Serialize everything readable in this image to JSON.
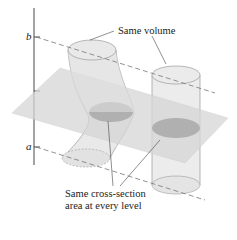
{
  "figure": {
    "topic": "Cavalieri's principle: solids with equal cross-section areas have equal volume",
    "axis_labels": {
      "top": "b",
      "bottom": "a"
    },
    "callouts": {
      "volume": "Same volume",
      "cross_section_line1": "Same cross-section",
      "cross_section_line2": "area at every level"
    },
    "colors": {
      "plane_fill": "#d9d9d9",
      "solid_fill": "#e6e6e6",
      "solid_stroke": "#9a9a9a",
      "cross_section_fill": "#a9a9a9",
      "axis": "#333333",
      "dashed": "#777777"
    }
  }
}
